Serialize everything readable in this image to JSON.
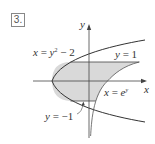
{
  "problem": {
    "number": "3."
  },
  "diagram": {
    "axes": {
      "x_label": "x",
      "y_label": "y"
    },
    "curves": [
      {
        "name": "parabola",
        "equation": "x = y² − 2",
        "label_parts": [
          "x",
          " = ",
          "y",
          "2",
          " − 2"
        ]
      },
      {
        "name": "exponential",
        "equation": "x = eʸ",
        "label_parts": [
          "x",
          " = ",
          "e",
          "y"
        ]
      },
      {
        "name": "upper-line",
        "equation": "y = 1",
        "label_parts": [
          "y",
          " = 1"
        ]
      },
      {
        "name": "lower-line",
        "equation": "y = −1",
        "label_parts": [
          "y",
          " = −1"
        ]
      }
    ],
    "region": {
      "description": "Shaded region bounded by x = y² − 2, x = eʸ, y = 1, y = −1",
      "fill": "#d9d9d9"
    },
    "colors": {
      "stroke": "#333333",
      "shade": "#d9d9d9",
      "axis": "#444444"
    }
  }
}
